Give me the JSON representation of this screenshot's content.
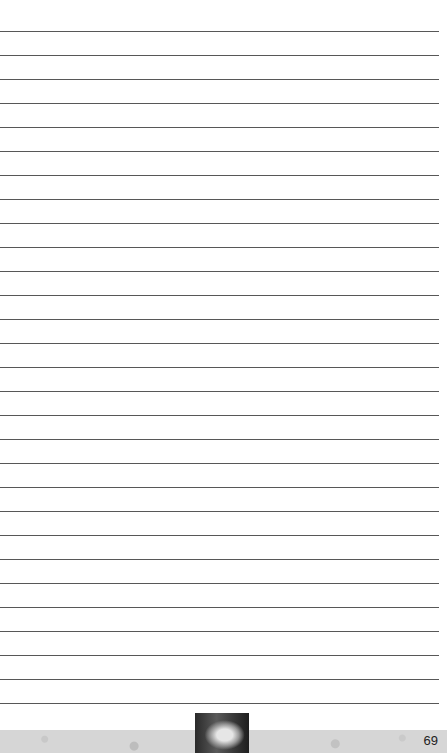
{
  "page": {
    "type": "lined-notes-page",
    "line_count": 29,
    "first_line_y": 31,
    "line_spacing": 24,
    "line_color": "#3a3a3a",
    "footer_color": "#d6d6d6",
    "page_number": "69"
  }
}
